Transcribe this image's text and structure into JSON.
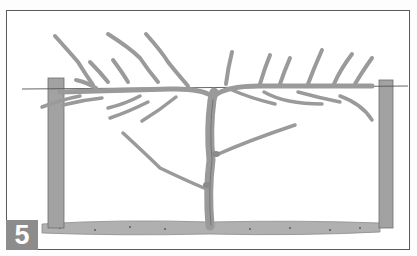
{
  "illustration": {
    "subject": "grapevine trained on a trellis wire between two posts, pruned spurs",
    "step_number": "5",
    "colors": {
      "frame": "#5a5a5a",
      "post": "#9a9a9a",
      "vine": "#9c9c9c",
      "ground": "#a8a8a8",
      "badge_bg": "#8c8c8c",
      "badge_text": "#ffffff"
    }
  }
}
